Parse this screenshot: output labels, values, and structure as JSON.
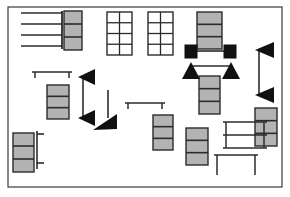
{
  "figure": {
    "title": "",
    "type": "schematic-floor-plan",
    "canvas": {
      "width": 290,
      "height": 197,
      "background": "#ffffff"
    },
    "border": {
      "name": "plan-outline",
      "x": 8,
      "y": 7,
      "width": 274,
      "height": 180,
      "stroke": "#3a3a3a",
      "stroke_width": 1.2,
      "fill": "none"
    },
    "palette": {
      "outline": "#3a3a3a",
      "line": "#2b2b2b",
      "module_fill": "#b3b3b3",
      "module_stroke": "#2b2b2b",
      "solid_black": "#111111",
      "background": "#ffffff"
    },
    "legend_note": "gray stacked cells = module stacks; solid black squares = nodes; solid triangles = directional markers",
    "elements": {
      "comb_rack": {
        "name": "comb-rack",
        "spine": {
          "x": 62,
          "y1": 11,
          "y2": 49
        },
        "rungs": [
          {
            "x1": 21,
            "x2": 62,
            "y": 13
          },
          {
            "x1": 21,
            "x2": 62,
            "y": 24
          },
          {
            "x1": 21,
            "x2": 62,
            "y": 35
          },
          {
            "x1": 21,
            "x2": 62,
            "y": 46
          }
        ]
      },
      "module_stacks": [
        {
          "name": "module-stack-1",
          "x": 64,
          "y": 11,
          "width": 18,
          "height": 39,
          "cells": 3
        },
        {
          "name": "module-stack-2",
          "x": 197,
          "y": 12,
          "width": 25,
          "height": 37,
          "cells": 3
        },
        {
          "name": "module-stack-3",
          "x": 255,
          "y": 108,
          "width": 22,
          "height": 38,
          "cells": 3
        },
        {
          "name": "module-stack-4",
          "x": 47,
          "y": 85,
          "width": 22,
          "height": 34,
          "cells": 3
        },
        {
          "name": "module-stack-5",
          "x": 13,
          "y": 133,
          "width": 21,
          "height": 39,
          "cells": 3
        },
        {
          "name": "module-stack-6",
          "x": 199,
          "y": 76,
          "width": 21,
          "height": 38,
          "cells": 3
        },
        {
          "name": "module-stack-7",
          "x": 153,
          "y": 115,
          "width": 20,
          "height": 35,
          "cells": 3
        },
        {
          "name": "module-stack-8",
          "x": 186,
          "y": 128,
          "width": 22,
          "height": 37,
          "cells": 3
        }
      ],
      "ladder_grids": [
        {
          "name": "ladder-grid-left",
          "x": 107,
          "y": 12,
          "width": 25,
          "height": 43,
          "cols": 2,
          "rows": 4
        },
        {
          "name": "ladder-grid-right",
          "x": 148,
          "y": 12,
          "width": 25,
          "height": 43,
          "cols": 2,
          "rows": 4
        }
      ],
      "node_squares": [
        {
          "name": "node-square-left",
          "x": 185,
          "y": 45,
          "width": 12,
          "height": 13
        },
        {
          "name": "node-square-right",
          "x": 224,
          "y": 45,
          "width": 12,
          "height": 13
        }
      ],
      "node_link": {
        "name": "node-link",
        "x1": 197,
        "x2": 224,
        "y": 51
      },
      "up_triangles": [
        {
          "name": "up-triangle-left",
          "cx": 191,
          "base_y": 79,
          "half_width": 9,
          "height": 17
        },
        {
          "name": "up-triangle-right",
          "cx": 231,
          "base_y": 79,
          "half_width": 9,
          "height": 17
        }
      ],
      "triangle_link": {
        "name": "triangle-link",
        "x1": 191,
        "x2": 231,
        "y": 66
      },
      "left_triangle_pairs": [
        {
          "name": "left-arrow-pair-inner",
          "tip_x": 78,
          "back_x": 95,
          "top": {
            "cy": 77,
            "half_height": 8
          },
          "bottom": {
            "cy": 118,
            "half_height": 8
          },
          "connector_x": 83
        },
        {
          "name": "left-arrow-pair-outer",
          "tip_x": 255,
          "back_x": 274,
          "top": {
            "cy": 50,
            "half_height": 8
          },
          "bottom": {
            "cy": 95,
            "half_height": 8
          },
          "connector_x": 259
        }
      ],
      "down_arrow": {
        "name": "down-arrow-center",
        "shaft_x": 108,
        "shaft_y1": 90,
        "shaft_y2": 118,
        "tip_y": 130,
        "half_width": 9,
        "head_height": 14,
        "direction": "down-left"
      },
      "tables": [
        {
          "name": "table-left",
          "x": 32,
          "y": 72,
          "width": 40,
          "leg_height": 6
        },
        {
          "name": "table-center",
          "x": 125,
          "y": 103,
          "width": 40,
          "leg_height": 6
        },
        {
          "name": "table-right-top",
          "x": 223,
          "y": 122,
          "width": 44,
          "height": 26,
          "shelves": 2,
          "leg_height": 26
        },
        {
          "name": "table-right-bottom",
          "x": 214,
          "y": 155,
          "width": 44,
          "leg_height": 20
        }
      ],
      "brackets": [
        {
          "name": "bracket-left",
          "x": 37,
          "y1": 131,
          "y2": 169,
          "arm_length": 7,
          "arms_at": [
            134,
            163
          ]
        }
      ]
    }
  }
}
